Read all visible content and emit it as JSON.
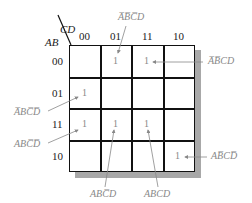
{
  "kmap": {
    "row_variable": "AB",
    "col_variable": "CD",
    "columns": [
      "00",
      "01",
      "11",
      "10"
    ],
    "rows": [
      "00",
      "01",
      "11",
      "10"
    ],
    "cells": [
      [
        "",
        "1",
        "1",
        ""
      ],
      [
        "1",
        "",
        "",
        ""
      ],
      [
        "1",
        "1",
        "1",
        ""
      ],
      [
        "",
        "",
        "",
        "1"
      ]
    ]
  },
  "annotations": [
    {
      "row": "00",
      "col": "01",
      "term": "A̅B̅C̅D"
    },
    {
      "row": "00",
      "col": "11",
      "term": "A̅B̅CD"
    },
    {
      "row": "01",
      "col": "00",
      "term": "A̅BC̅D̅"
    },
    {
      "row": "11",
      "col": "00",
      "term": "ABC̅D̅"
    },
    {
      "row": "11",
      "col": "01",
      "term": "ABC̅D"
    },
    {
      "row": "11",
      "col": "11",
      "term": "ABCD"
    },
    {
      "row": "10",
      "col": "10",
      "term": "AB̅CD̅"
    }
  ],
  "colors": {
    "grid": "#111111",
    "annotation": "#888888",
    "shadow": "#a8a8a8"
  }
}
